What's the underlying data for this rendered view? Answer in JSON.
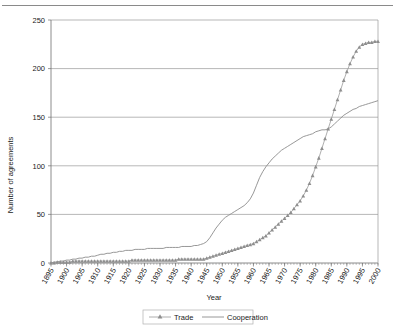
{
  "chart_data": {
    "type": "line",
    "title": "",
    "xlabel": "Year",
    "ylabel": "Number of agreements",
    "xlim": [
      1895,
      2000
    ],
    "ylim": [
      0,
      250
    ],
    "yticks": [
      0,
      50,
      100,
      150,
      200,
      250
    ],
    "xticks": [
      1895,
      1900,
      1905,
      1910,
      1915,
      1920,
      1925,
      1930,
      1935,
      1940,
      1945,
      1950,
      1955,
      1960,
      1965,
      1970,
      1975,
      1980,
      1985,
      1990,
      1995,
      2000
    ],
    "grid": "horizontal",
    "legend_position": "bottom",
    "x": [
      1895,
      1896,
      1897,
      1898,
      1899,
      1900,
      1901,
      1902,
      1903,
      1904,
      1905,
      1906,
      1907,
      1908,
      1909,
      1910,
      1911,
      1912,
      1913,
      1914,
      1915,
      1916,
      1917,
      1918,
      1919,
      1920,
      1921,
      1922,
      1923,
      1924,
      1925,
      1926,
      1927,
      1928,
      1929,
      1930,
      1931,
      1932,
      1933,
      1934,
      1935,
      1936,
      1937,
      1938,
      1939,
      1940,
      1941,
      1942,
      1943,
      1944,
      1945,
      1946,
      1947,
      1948,
      1949,
      1950,
      1951,
      1952,
      1953,
      1954,
      1955,
      1956,
      1957,
      1958,
      1959,
      1960,
      1961,
      1962,
      1963,
      1964,
      1965,
      1966,
      1967,
      1968,
      1969,
      1970,
      1971,
      1972,
      1973,
      1974,
      1975,
      1976,
      1977,
      1978,
      1979,
      1980,
      1981,
      1982,
      1983,
      1984,
      1985,
      1986,
      1987,
      1988,
      1989,
      1990,
      1991,
      1992,
      1993,
      1994,
      1995,
      1996,
      1997,
      1998,
      1999,
      2000
    ],
    "series": [
      {
        "name": "Trade",
        "marker": "triangle",
        "color": "#8e8e8e",
        "values": [
          0,
          0,
          1,
          1,
          1,
          1,
          1,
          2,
          2,
          2,
          2,
          2,
          2,
          2,
          2,
          2,
          2,
          2,
          2,
          2,
          2,
          2,
          2,
          2,
          2,
          2,
          3,
          3,
          3,
          3,
          3,
          3,
          3,
          3,
          3,
          3,
          3,
          3,
          3,
          3,
          3,
          4,
          4,
          4,
          4,
          4,
          4,
          4,
          4,
          4,
          5,
          6,
          7,
          8,
          9,
          10,
          11,
          12,
          13,
          14,
          15,
          16,
          17,
          18,
          19,
          20,
          22,
          24,
          26,
          28,
          31,
          34,
          37,
          40,
          43,
          46,
          49,
          52,
          56,
          60,
          64,
          69,
          75,
          82,
          90,
          99,
          108,
          118,
          128,
          138,
          148,
          158,
          168,
          178,
          188,
          197,
          205,
          212,
          218,
          222,
          225,
          226,
          227,
          227,
          228,
          228
        ]
      },
      {
        "name": "Cooperation",
        "marker": "none",
        "color": "#8c8c8c",
        "values": [
          0,
          1,
          1,
          2,
          2,
          3,
          3,
          4,
          4,
          5,
          5,
          6,
          6,
          7,
          7,
          8,
          9,
          9,
          10,
          10,
          11,
          11,
          12,
          12,
          13,
          13,
          13,
          14,
          14,
          14,
          14,
          15,
          15,
          15,
          15,
          15,
          15,
          16,
          16,
          16,
          16,
          16,
          17,
          17,
          17,
          17,
          18,
          18,
          19,
          20,
          22,
          26,
          31,
          36,
          40,
          44,
          47,
          49,
          51,
          53,
          55,
          57,
          59,
          62,
          66,
          72,
          80,
          88,
          94,
          99,
          103,
          107,
          110,
          113,
          116,
          118,
          120,
          122,
          124,
          126,
          128,
          130,
          131,
          132,
          133,
          135,
          136,
          137,
          137,
          138,
          140,
          143,
          146,
          149,
          152,
          154,
          156,
          158,
          159,
          161,
          162,
          163,
          164,
          165,
          166,
          167
        ]
      }
    ]
  },
  "legend": {
    "items": [
      {
        "label": "Trade"
      },
      {
        "label": "Cooperation"
      }
    ]
  }
}
